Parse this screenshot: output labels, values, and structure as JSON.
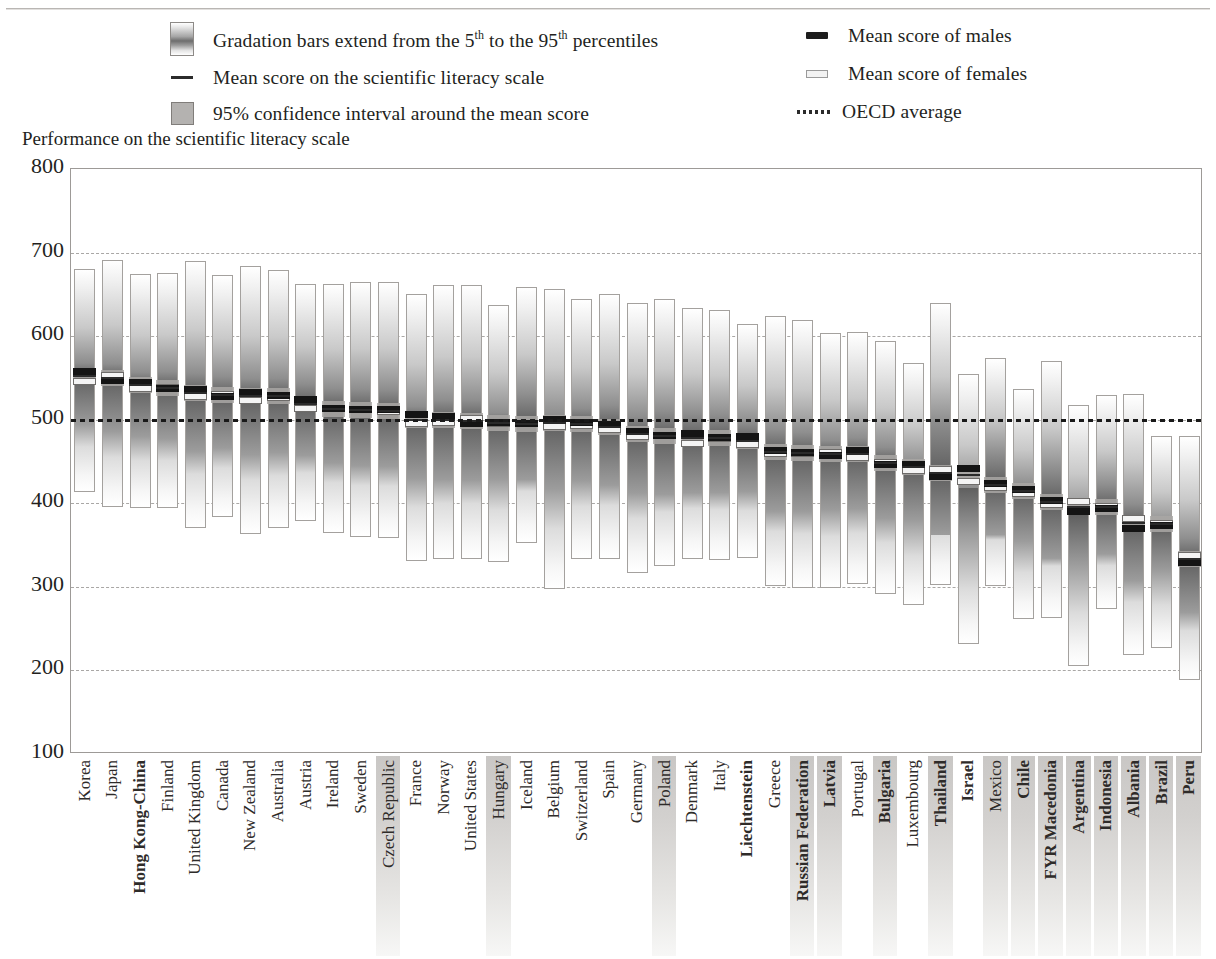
{
  "axis_title": "Performance on the scientific literacy scale",
  "legend": {
    "gradation": {
      "pre": "Gradation bars extend from the 5",
      "sup1": "th",
      "mid": " to the 95",
      "sup2": "th",
      "post": " percentiles",
      "icon": "gradient-bar-swatch"
    },
    "mean": {
      "label": "Mean score on the scientific literacy scale",
      "icon": "mean-line-swatch"
    },
    "ci": {
      "label": "95% confidence interval around the mean score",
      "icon": "confidence-box-swatch"
    },
    "male": {
      "label": "Mean score of males",
      "icon": "male-marker-swatch"
    },
    "female": {
      "label": "Mean score of females",
      "icon": "female-marker-swatch"
    },
    "oecd": {
      "label": "OECD average",
      "icon": "dotted-line-swatch"
    }
  },
  "colors": {
    "male_marker": "#141414",
    "female_marker": "#f4f4f4",
    "mean_marker": "#2a2a2a",
    "ci_band": "#a9a7a5",
    "grid": "#a9a7a5",
    "axis": "#9d9a97",
    "label_shade": "#c9c7c5"
  },
  "chart_data": {
    "type": "bar",
    "title": "Performance on the scientific literacy scale",
    "xlabel": "",
    "ylabel": "Performance on the scientific literacy scale",
    "ylim": [
      100,
      800
    ],
    "yticks": [
      100,
      200,
      300,
      400,
      500,
      600,
      700,
      800
    ],
    "grid": true,
    "legend_position": "top",
    "oecd_average": 500,
    "categories": [
      "Korea",
      "Japan",
      "Hong Kong-China",
      "Finland",
      "United Kingdom",
      "Canada",
      "New Zealand",
      "Australia",
      "Austria",
      "Ireland",
      "Sweden",
      "Czech Republic",
      "France",
      "Norway",
      "United States",
      "Hungary",
      "Iceland",
      "Belgium",
      "Switzerland",
      "Spain",
      "Germany",
      "Poland",
      "Denmark",
      "Italy",
      "Liechtenstein",
      "Greece",
      "Russian Federation",
      "Latvia",
      "Portugal",
      "Bulgaria",
      "Luxembourg",
      "Thailand",
      "Israel",
      "Mexico",
      "Chile",
      "FYR Macedonia",
      "Argentina",
      "Indonesia",
      "Albania",
      "Brazil",
      "Peru"
    ],
    "series": [
      {
        "name": "5th percentile",
        "values": [
          413,
          395,
          394,
          394,
          370,
          383,
          363,
          370,
          379,
          364,
          360,
          358,
          331,
          333,
          333,
          330,
          352,
          297,
          333,
          333,
          316,
          325,
          333,
          332,
          334,
          301,
          299,
          299,
          303,
          291,
          278,
          302,
          232,
          301,
          262,
          263,
          205,
          273,
          219,
          227,
          189
        ]
      },
      {
        "name": "95th percentile",
        "values": [
          680,
          691,
          674,
          675,
          690,
          673,
          684,
          679,
          662,
          662,
          665,
          665,
          651,
          661,
          661,
          637,
          659,
          657,
          645,
          651,
          640,
          645,
          634,
          631,
          615,
          624,
          619,
          604,
          605,
          594,
          568,
          640,
          555,
          574,
          537,
          570,
          518,
          530,
          531,
          480,
          480
        ]
      },
      {
        "name": "mean",
        "values": [
          552,
          550,
          541,
          538,
          532,
          529,
          528,
          528,
          519,
          513,
          512,
          511,
          500,
          500,
          499,
          496,
          495,
          496,
          495,
          491,
          483,
          481,
          478,
          478,
          475,
          461,
          460,
          459,
          459,
          448,
          443,
          436,
          434,
          422,
          415,
          401,
          396,
          395,
          376,
          375,
          333
        ]
      },
      {
        "name": "mean males",
        "values": [
          558,
          547,
          545,
          537,
          536,
          528,
          533,
          529,
          524,
          513,
          512,
          512,
          506,
          504,
          495,
          497,
          495,
          500,
          497,
          494,
          486,
          481,
          484,
          479,
          480,
          463,
          461,
          457,
          463,
          447,
          447,
          432,
          442,
          424,
          417,
          403,
          390,
          394,
          370,
          374,
          329
        ]
      },
      {
        "name": "mean females",
        "values": [
          546,
          553,
          537,
          539,
          528,
          530,
          523,
          527,
          514,
          513,
          512,
          510,
          495,
          497,
          502,
          495,
          495,
          492,
          493,
          488,
          480,
          481,
          472,
          477,
          470,
          459,
          459,
          461,
          455,
          449,
          439,
          440,
          426,
          419,
          412,
          399,
          402,
          396,
          382,
          376,
          337
        ]
      }
    ],
    "bold_categories": [
      "Hong Kong-China",
      "Liechtenstein",
      "Russian Federation",
      "Latvia",
      "Bulgaria",
      "Thailand",
      "Israel",
      "Chile",
      "FYR Macedonia",
      "Argentina",
      "Indonesia",
      "Albania",
      "Brazil",
      "Peru"
    ],
    "shaded_categories": [
      "Czech Republic",
      "Hungary",
      "Poland",
      "Russian Federation",
      "Latvia",
      "Bulgaria",
      "Thailand",
      "Mexico",
      "Chile",
      "FYR Macedonia",
      "Argentina",
      "Indonesia",
      "Albania",
      "Brazil",
      "Peru"
    ]
  }
}
